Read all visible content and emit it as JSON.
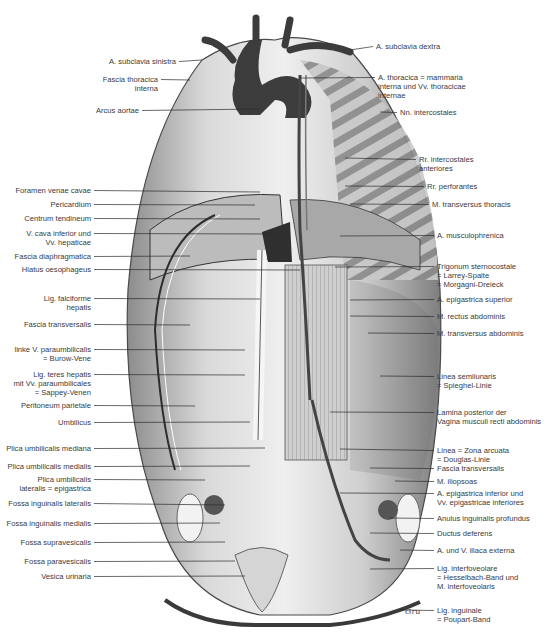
{
  "figure": {
    "type": "anatomical-illustration"
  },
  "labels_left": [
    {
      "id": "a-subclavia-sinistra",
      "lines": [
        "A. subclavia sinistra"
      ],
      "x": 176,
      "y": 57,
      "tx": 202,
      "ty": 60
    },
    {
      "id": "fascia-thoracica-interna",
      "lines": [
        "Fascia thoracica",
        "interna"
      ],
      "x": 158,
      "y": 75,
      "tx": 190,
      "ty": 80
    },
    {
      "id": "arcus-aortae",
      "lines": [
        "Arcus aortae"
      ],
      "x": 139,
      "y": 106,
      "tx": 260,
      "ty": 109
    },
    {
      "id": "foramen-venae-cavae",
      "lines": [
        "Foramen venae cavae"
      ],
      "x": 91,
      "y": 186,
      "tx": 260,
      "ty": 192
    },
    {
      "id": "pericardium",
      "lines": [
        "Pericardium"
      ],
      "x": 91,
      "y": 200,
      "tx": 255,
      "ty": 205
    },
    {
      "id": "centrum-tendineum",
      "lines": [
        "Centrum tendineum"
      ],
      "x": 91,
      "y": 214,
      "tx": 260,
      "ty": 219
    },
    {
      "id": "v-cava-inferior",
      "lines": [
        "V. cava inferior und",
        "Vv. hepaticae"
      ],
      "x": 91,
      "y": 229,
      "tx": 275,
      "ty": 234
    },
    {
      "id": "fascia-diaphragmatica",
      "lines": [
        "Fascia diaphragmatica"
      ],
      "x": 91,
      "y": 252,
      "tx": 190,
      "ty": 256
    },
    {
      "id": "hiatus-oesophageus",
      "lines": [
        "Hiatus oesophageus"
      ],
      "x": 91,
      "y": 265,
      "tx": 300,
      "ty": 270
    },
    {
      "id": "lig-falciforme",
      "lines": [
        "Lig. falciforme",
        "hepatis"
      ],
      "x": 91,
      "y": 294,
      "tx": 260,
      "ty": 299
    },
    {
      "id": "fascia-transversalis-left",
      "lines": [
        "Fascia transversalis"
      ],
      "x": 91,
      "y": 320,
      "tx": 190,
      "ty": 325
    },
    {
      "id": "v-paraumbilicalis",
      "lines": [
        "linke V. paraumbilicalis",
        "= Burow-Vene"
      ],
      "x": 91,
      "y": 345,
      "tx": 245,
      "ty": 350
    },
    {
      "id": "lig-teres-hepatis",
      "lines": [
        "Lig. teres hepatis",
        "mit Vv. paraumbilicales",
        "= Sappey-Venen"
      ],
      "x": 91,
      "y": 370,
      "tx": 245,
      "ty": 375
    },
    {
      "id": "peritoneum-parietale",
      "lines": [
        "Peritoneum parietale"
      ],
      "x": 91,
      "y": 401,
      "tx": 195,
      "ty": 406
    },
    {
      "id": "umbilicus",
      "lines": [
        "Umbilicus"
      ],
      "x": 91,
      "y": 418,
      "tx": 250,
      "ty": 422
    },
    {
      "id": "plica-umbilicalis-mediana",
      "lines": [
        "Plica umbilicalis mediana"
      ],
      "x": 91,
      "y": 444,
      "tx": 265,
      "ty": 448
    },
    {
      "id": "plica-umbilicalis-medialis",
      "lines": [
        "Plica umbilicalis medialis"
      ],
      "x": 91,
      "y": 462,
      "tx": 250,
      "ty": 466
    },
    {
      "id": "plica-umbilicalis-lateralis",
      "lines": [
        "Plica umbilicalis",
        "lateralis = epigastrica"
      ],
      "x": 91,
      "y": 475,
      "tx": 205,
      "ty": 480
    },
    {
      "id": "fossa-inguinalis-lateralis",
      "lines": [
        "Fossa inguinalis lateralis"
      ],
      "x": 91,
      "y": 499,
      "tx": 225,
      "ty": 505
    },
    {
      "id": "fossa-inguinalis-medialis",
      "lines": [
        "Fossa inguinalis medialis"
      ],
      "x": 91,
      "y": 519,
      "tx": 220,
      "ty": 523
    },
    {
      "id": "fossa-supravesicalis",
      "lines": [
        "Fossa supravesicalis"
      ],
      "x": 91,
      "y": 538,
      "tx": 225,
      "ty": 542
    },
    {
      "id": "fossa-paravesicalis",
      "lines": [
        "Fossa paravesicalis"
      ],
      "x": 91,
      "y": 557,
      "tx": 235,
      "ty": 561
    },
    {
      "id": "vesica-urinaria",
      "lines": [
        "Vesica urinaria"
      ],
      "x": 91,
      "y": 572,
      "tx": 245,
      "ty": 576
    }
  ],
  "labels_right": [
    {
      "id": "a-subclavia-dextra",
      "lines": [
        "A. subclavia dextra"
      ],
      "x": 376,
      "y": 42,
      "tx": 350,
      "ty": 50
    },
    {
      "id": "a-thoracica-interna",
      "lines": [
        "A. thoracica = mammaria",
        "interna und Vv. thoracicae",
        "internae"
      ],
      "x": 378,
      "y": 73,
      "tx": 300,
      "ty": 78
    },
    {
      "id": "nn-intercostales",
      "lines": [
        "Nn. intercostales"
      ],
      "x": 400,
      "y": 108,
      "tx": 380,
      "ty": 112
    },
    {
      "id": "rr-intercostales-anteriores",
      "lines": [
        "Rr. intercostales",
        "anteriores"
      ],
      "x": 419,
      "y": 155,
      "tx": 345,
      "ty": 158
    },
    {
      "id": "rr-perforantes",
      "lines": [
        "Rr. perforantes"
      ],
      "x": 427,
      "y": 182,
      "tx": 345,
      "ty": 186
    },
    {
      "id": "m-transversus-thoracis",
      "lines": [
        "M. transversus thoracis"
      ],
      "x": 432,
      "y": 200,
      "tx": 350,
      "ty": 204
    },
    {
      "id": "a-musculophrenica",
      "lines": [
        "A. musculophrenica"
      ],
      "x": 437,
      "y": 231,
      "tx": 340,
      "ty": 236
    },
    {
      "id": "trigonum-sternocostale",
      "lines": [
        "Trigonum sternocostale",
        "= Larrey-Spalte",
        "= Morgagni-Dreieck"
      ],
      "x": 437,
      "y": 262,
      "tx": 335,
      "ty": 267
    },
    {
      "id": "a-epigastrica-superior",
      "lines": [
        "A. epigastrica superior"
      ],
      "x": 437,
      "y": 295,
      "tx": 350,
      "ty": 300
    },
    {
      "id": "m-rectus-abdominis",
      "lines": [
        "M. rectus abdominis"
      ],
      "x": 437,
      "y": 312,
      "tx": 350,
      "ty": 316
    },
    {
      "id": "m-transversus-abdominis",
      "lines": [
        "M. transversus abdominis"
      ],
      "x": 437,
      "y": 329,
      "tx": 368,
      "ty": 333
    },
    {
      "id": "linea-semilunaris",
      "lines": [
        "Linea semilunaris",
        "= Spieghel-Linie"
      ],
      "x": 437,
      "y": 372,
      "tx": 380,
      "ty": 376
    },
    {
      "id": "lamina-posterior",
      "lines": [
        "Lamina posterior der",
        "Vagina musculi recti abdominis"
      ],
      "x": 437,
      "y": 408,
      "tx": 330,
      "ty": 412
    },
    {
      "id": "linea-arcuata",
      "lines": [
        "Linea = Zona arcuata",
        "= Douglas-Linie"
      ],
      "x": 437,
      "y": 446,
      "tx": 340,
      "ty": 449
    },
    {
      "id": "fascia-transversalis-right",
      "lines": [
        "Fascia transversalis"
      ],
      "x": 437,
      "y": 464,
      "tx": 370,
      "ty": 468
    },
    {
      "id": "m-iliopsoas",
      "lines": [
        "M. iliopsoas"
      ],
      "x": 437,
      "y": 477,
      "tx": 395,
      "ty": 481
    },
    {
      "id": "a-epigastrica-inferior",
      "lines": [
        "A. epigastrica inferior und",
        "Vv. epigastricae inferiores"
      ],
      "x": 437,
      "y": 489,
      "tx": 340,
      "ty": 493
    },
    {
      "id": "anulus-inguinalis-profundus",
      "lines": [
        "Anulus inguinalis profundus"
      ],
      "x": 437,
      "y": 514,
      "tx": 390,
      "ty": 518
    },
    {
      "id": "ductus-deferens",
      "lines": [
        "Ductus deferens"
      ],
      "x": 437,
      "y": 529,
      "tx": 370,
      "ty": 533
    },
    {
      "id": "a-v-iliaca-externa",
      "lines": [
        "A. und V. iliaca externa"
      ],
      "x": 437,
      "y": 546,
      "tx": 400,
      "ty": 550
    },
    {
      "id": "lig-interfoveolare",
      "lines": [
        "Lig. interfoveolare",
        "= Hesselbach-Band und",
        "M. interfoveolaris"
      ],
      "x": 437,
      "y": 564,
      "tx": 370,
      "ty": 569
    },
    {
      "id": "lig-inguinale",
      "lines": [
        "Lig. inguinale",
        "= Poupart-Band"
      ],
      "x": 437,
      "y": 606,
      "tx": 400,
      "ty": 610
    }
  ],
  "signature": "Gru",
  "colors": {
    "ink": "#3a3a3a",
    "line": "#2b2b2b",
    "vessel": "#3f3f3f",
    "tissue_light": "#d6d6d6",
    "tissue_mid": "#a9a9a9",
    "tissue_dark": "#6e6e6e",
    "background": "#ffffff"
  }
}
